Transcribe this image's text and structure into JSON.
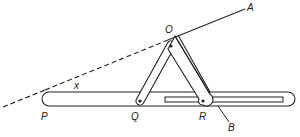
{
  "diagram": {
    "labels": {
      "O": "O",
      "A": "A",
      "P": "P",
      "Q": "Q",
      "R": "R",
      "B": "B",
      "angle": "x"
    },
    "colors": {
      "stroke": "#222222",
      "background": "#ffffff"
    }
  }
}
